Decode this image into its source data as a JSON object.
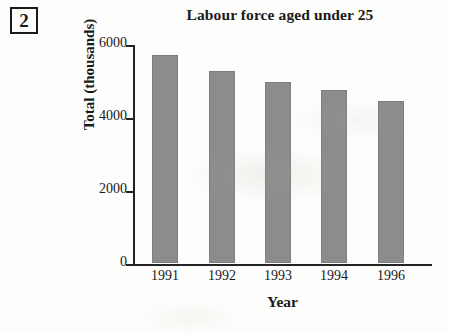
{
  "question_number": "2",
  "chart_data": {
    "type": "bar",
    "title": "Labour force aged under 25",
    "xlabel": "Year",
    "ylabel": "Total (thousands)",
    "categories": [
      "1991",
      "1992",
      "1993",
      "1994",
      "1996"
    ],
    "values": [
      5700,
      5250,
      4950,
      4750,
      4450
    ],
    "ytick_labels": [
      "6000",
      "4000",
      "2000",
      "0"
    ],
    "ytick_values": [
      6000,
      4000,
      2000,
      0
    ],
    "ylim": [
      0,
      6000
    ],
    "grid": false,
    "legend": false,
    "bar_color": "#8c8c8c",
    "axis_color": "#232323"
  }
}
